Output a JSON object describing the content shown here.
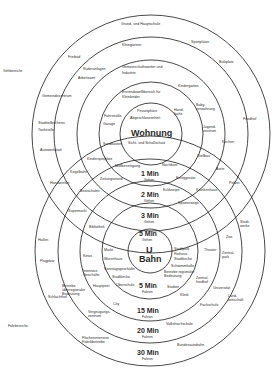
{
  "colors": {
    "line": "#1a1a1a",
    "text": "#2a2a2a",
    "background": "#ffffff"
  },
  "side_labels": {
    "top": "Gehbereiche",
    "bottom": "Fahrbereiche"
  },
  "top_system": {
    "center_label": "Wohnung",
    "center_sub": "Sicht- und Schallschutz",
    "center_extra": [
      "Privatsphäre",
      "Abgeschlossenheit"
    ],
    "rings": [
      {
        "time": "1 Min",
        "mode": "Gehen"
      },
      {
        "time": "2 Min",
        "mode": "Gehen"
      },
      {
        "time": "3 Min",
        "mode": "Gehen"
      }
    ],
    "ring1_items": [
      "Fahrstraße",
      "Garage",
      "Sandkasten",
      "Müllbeseitigung",
      "Nachbarn",
      "Hand-\nläche",
      "Erstendawelltbereich für",
      "Kleinkinder"
    ],
    "ring2_items": [
      "Gemeinschaftsweiter und",
      "Industrie",
      "Kindergarten",
      "Baby-\nverwahrung",
      "Jugend-\nzentrum",
      "Stellbau",
      "Fertiggeräte",
      "Eckkneipe",
      "Krankenhaus",
      "Kinderspielplatz",
      "Zeitungsstand",
      "Beatschulen"
    ],
    "ring3_items": [
      "Kleingärtner",
      "Ruderanlagen",
      "Arbeitsamt",
      "Gemeindezentrum",
      "Kirchen",
      "Ärzte",
      "Kegelbahn",
      "Spazierwege"
    ],
    "ring4_items": [
      "Grund- und Hauptschule",
      "Sportplätze",
      "Bolzplatz",
      "Freibad",
      "Friedhof",
      "Gemeindezentrum",
      "Stadtteilbücherei",
      "Tankstelle",
      "Autowerkstatt",
      "Handwerker",
      "Polizei"
    ]
  },
  "bottom_system": {
    "center_label_1": "U",
    "center_label_2": "Bahn",
    "center_time": "5 Min",
    "center_mode": "Gehen",
    "rings": [
      {
        "time": "5 Min",
        "mode": "Fahren"
      },
      {
        "time": "15 Min",
        "mode": "Fahren"
      },
      {
        "time": "20 Min",
        "mode": "Fahren"
      },
      {
        "time": "30 Min",
        "mode": "Fahren"
      }
    ],
    "ring1_items": [
      "Markt",
      "Warenhaus",
      "Sonntagsgeschäfte",
      "Stadtkirche",
      "Oberschule",
      "Stadtpark",
      "Rathaus",
      "Stadtkirche",
      "Schwimmhalle",
      "Betriebe regionaler\nBedeutung",
      "Stadion",
      "Klinik"
    ],
    "ring2_items": [
      "Bibliothek",
      "Kinos",
      "Intensive\nGeschäfte",
      "Hauptpost",
      "City",
      "Theater",
      "Zentral-\nfriedhof",
      "Fachschule"
    ],
    "ring3_items": [
      "Supermarkt",
      "Betriebe\nüberregionaler\nBedeutung",
      "Vergnügungs-\nzentrum",
      "Zoo",
      "Zentral-\npark",
      "Universität",
      "Volkshochschule"
    ],
    "ring4_items": [
      "Hallen",
      "Flugplatz",
      "Schlachthof",
      "Flächenintensive\nFabrikbetriebe",
      "Stadt-\nwerke",
      "Land-\nwirtschaft",
      "Bundesautobahn"
    ]
  }
}
